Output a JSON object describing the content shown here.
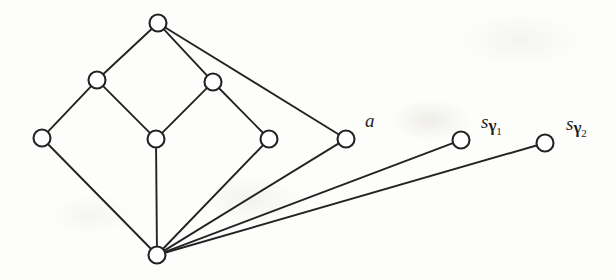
{
  "figure": {
    "kind": "graph-diagram",
    "background_color": "#fdfdfb",
    "node_fill": "#ffffff",
    "node_stroke": "#232323",
    "edge_stroke": "#232323",
    "node_radius": 8.5
  },
  "chart_data": {
    "type": "diagram",
    "title": "",
    "nodes": [
      {
        "id": "top",
        "x": 158,
        "y": 23,
        "label": ""
      },
      {
        "id": "ul",
        "x": 97,
        "y": 80,
        "label": ""
      },
      {
        "id": "ur",
        "x": 213,
        "y": 82,
        "label": ""
      },
      {
        "id": "left",
        "x": 42,
        "y": 138,
        "label": ""
      },
      {
        "id": "center",
        "x": 156,
        "y": 139,
        "label": ""
      },
      {
        "id": "rmid",
        "x": 269,
        "y": 139,
        "label": ""
      },
      {
        "id": "a",
        "x": 346,
        "y": 139,
        "label": "a"
      },
      {
        "id": "sg1",
        "x": 461,
        "y": 140,
        "label": "s_gamma_1"
      },
      {
        "id": "sg2",
        "x": 545,
        "y": 143,
        "label": "s_gamma_2"
      },
      {
        "id": "bottom",
        "x": 157,
        "y": 255,
        "label": ""
      }
    ],
    "edges": [
      [
        "top",
        "ul"
      ],
      [
        "top",
        "ur"
      ],
      [
        "top",
        "a"
      ],
      [
        "ul",
        "left"
      ],
      [
        "ul",
        "center"
      ],
      [
        "ur",
        "center"
      ],
      [
        "ur",
        "rmid"
      ],
      [
        "left",
        "bottom"
      ],
      [
        "center",
        "bottom"
      ],
      [
        "rmid",
        "bottom"
      ],
      [
        "a",
        "bottom"
      ],
      [
        "sg1",
        "bottom"
      ],
      [
        "sg2",
        "bottom"
      ]
    ]
  },
  "labels": {
    "a": {
      "main": "a",
      "sub": "",
      "subnum": ""
    },
    "sg1": {
      "main": "s",
      "sub": "γ",
      "subnum": "1"
    },
    "sg2": {
      "main": "s",
      "sub": "γ",
      "subnum": "2"
    }
  }
}
